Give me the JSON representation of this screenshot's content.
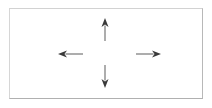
{
  "figure": {
    "background_color": "#ffffff",
    "width": 212,
    "height": 108
  },
  "frame": {
    "name": "diagram-border",
    "shape": "rectangle",
    "stroke_color": "#c4c4c4",
    "fill_color": "#ffffff",
    "x": 9,
    "y": 8,
    "width": 194,
    "height": 91
  },
  "diagram": {
    "type": "arrow-diagram",
    "center": {
      "x": 106,
      "y": 54
    },
    "arrow_color": "#3a3a3a",
    "shaft_color": "#8a8a8a",
    "arrow_count": 4,
    "arrows": [
      {
        "id": "arrow-up",
        "direction": "up",
        "label": "",
        "tail": {
          "x": 105,
          "y": 41
        },
        "tip": {
          "x": 105,
          "y": 18
        },
        "length": 23,
        "head_width": 7,
        "head_length": 9
      },
      {
        "id": "arrow-down",
        "direction": "down",
        "label": "",
        "tail": {
          "x": 105,
          "y": 65
        },
        "tip": {
          "x": 105,
          "y": 88
        },
        "length": 23,
        "head_width": 7,
        "head_length": 9
      },
      {
        "id": "arrow-left",
        "direction": "left",
        "label": "",
        "tail": {
          "x": 83,
          "y": 54
        },
        "tip": {
          "x": 58,
          "y": 54
        },
        "length": 25,
        "head_width": 7,
        "head_length": 9
      },
      {
        "id": "arrow-right",
        "direction": "right",
        "label": "",
        "tail": {
          "x": 136,
          "y": 54
        },
        "tip": {
          "x": 161,
          "y": 54
        },
        "length": 25,
        "head_width": 7,
        "head_length": 9
      }
    ]
  }
}
